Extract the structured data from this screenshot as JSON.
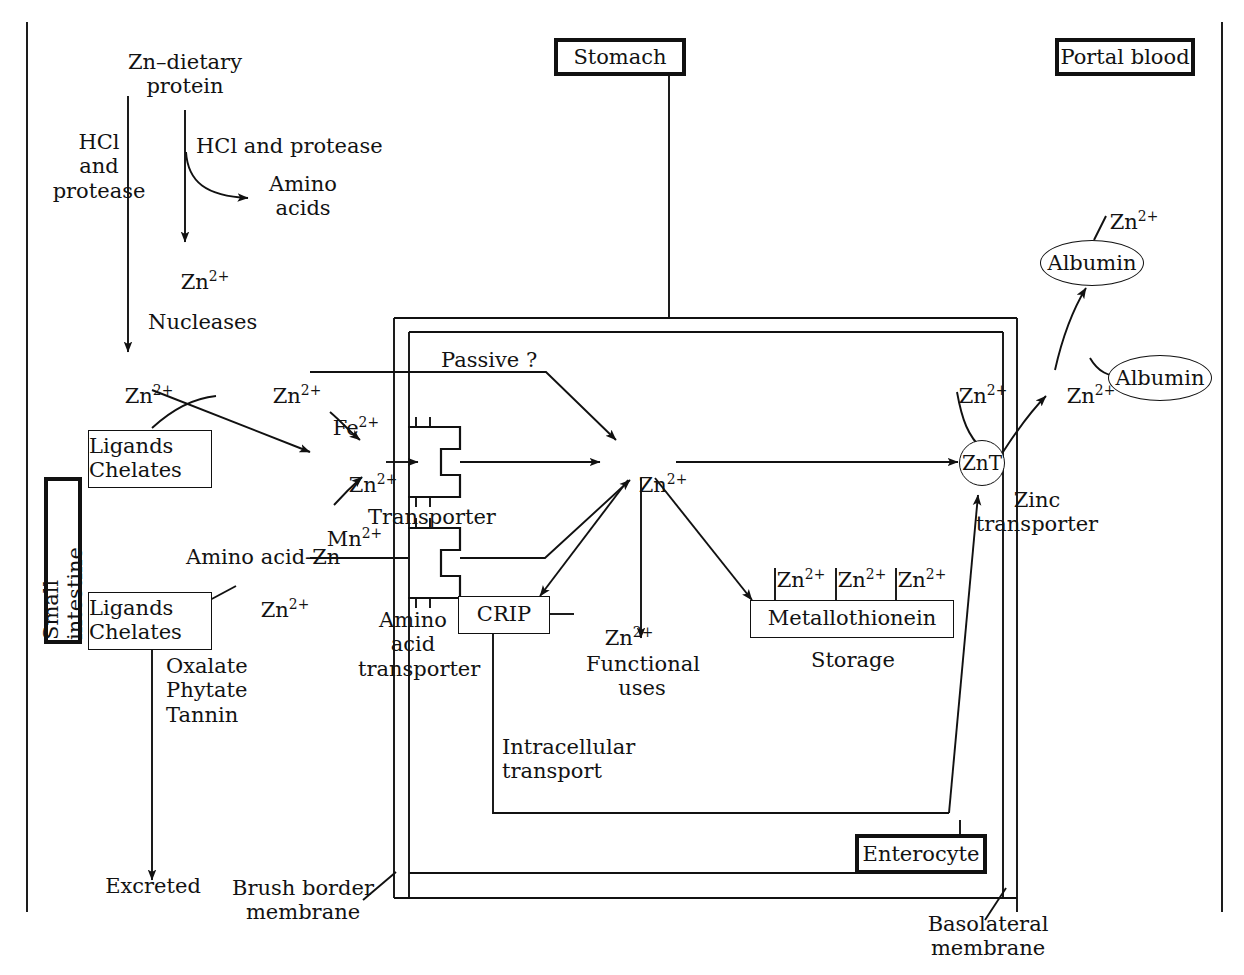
{
  "figure": {
    "type": "diagram"
  },
  "compartments": {
    "stomach": "Stomach",
    "portal_blood": "Portal blood",
    "small_intestine": "Small intestine",
    "enterocyte": "Enterocyte"
  },
  "membranes": {
    "brush_border": "Brush border\nmembrane",
    "basolateral": "Basolateral\nmembrane"
  },
  "nodes": {
    "zn_dietary_protein": "Zn–dietary\nprotein",
    "hcl_and_protease_left": "HCl\nand\nprotease",
    "hcl_and_protease_right": "HCl and protease",
    "amino_acids": "Amino\nacids",
    "nucleases": "Nucleases",
    "ligands_chelates_1": "Ligands\nChelates",
    "ligands_chelates_2": "Ligands\nChelates",
    "oxalate_phytate_tannin": "Oxalate\nPhytate\nTannin",
    "excreted": "Excreted",
    "amino_acid_zn": "Amino acid-Zn",
    "passive": "Passive ?",
    "transporter": "Transporter",
    "amino_acid_transporter": "Amino\nacid\ntransporter",
    "crip": "CRIP",
    "intracellular_transport": "Intracellular\ntransport",
    "functional_uses": "Functional\nuses",
    "metallothionein": "Metallothionein",
    "storage": "Storage",
    "znt": "ZnT",
    "zinc_transporter": "Zinc\ntransporter",
    "albumin_bound": "Albumin",
    "albumin_free": "Albumin"
  },
  "ions": {
    "zn": "Zn",
    "zn_charge": "2+",
    "fe": "Fe",
    "fe_charge": "2+",
    "mn": "Mn",
    "mn_charge": "2+"
  },
  "ion_labels": {
    "zn_from_protein": "Zn2+",
    "zn_lumen_left": "Zn2+",
    "zn_lumen_mid": "Zn2+",
    "zn_at_transporter": "Zn2+",
    "zn_from_ligands2": "Zn2+",
    "zn_intracellular": "Zn2+",
    "zn_crip": "Zn2+",
    "zn_mt_1": "Zn2+",
    "zn_mt_2": "Zn2+",
    "zn_mt_3": "Zn2+",
    "zn_to_znt": "Zn2+",
    "zn_portal": "Zn2+",
    "zn_on_albumin": "Zn2+",
    "fe_in": "Fe2+",
    "mn_in": "Mn2+"
  },
  "colors": {
    "stroke": "#111111",
    "background": "#ffffff",
    "text": "#121212"
  }
}
